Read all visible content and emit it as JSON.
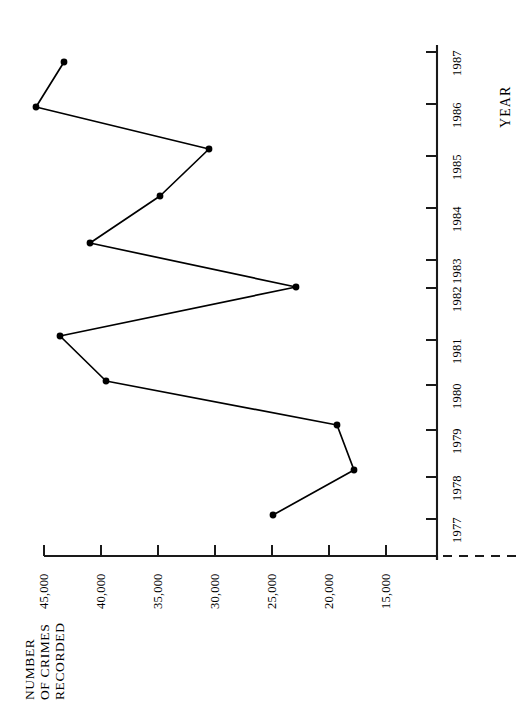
{
  "chart_data": {
    "type": "line",
    "title": "",
    "orientation": "rotated-90",
    "xlabel": "YEAR",
    "ylabel": "NUMBER OF CRIMES RECORDED",
    "ylabel_lines": [
      "NUMBER",
      "OF CRIMES",
      "RECORDED"
    ],
    "categories": [
      "1977",
      "1978",
      "1979",
      "1980",
      "1981",
      "1982",
      "1983",
      "1984",
      "1985",
      "1986",
      "1987"
    ],
    "values": [
      25000,
      17800,
      19300,
      39500,
      46400,
      22900,
      40900,
      35200,
      30900,
      45700,
      43200
    ],
    "ylim": [
      15000,
      45000
    ],
    "ytick_labels": [
      "45,000",
      "40,000",
      "35,000",
      "30,000",
      "25,000",
      "20,000",
      "15,000"
    ],
    "ytick_values": [
      45000,
      40000,
      35000,
      30000,
      25000,
      20000,
      15000
    ],
    "xtick_labels": [
      "1987",
      "1986",
      "1985",
      "1984",
      "1983",
      "1982",
      "1981",
      "1980",
      "1979",
      "1978",
      "1977"
    ],
    "grid": false,
    "legend": null,
    "marker": "filled-circle",
    "line_color": "#000000",
    "marker_color": "#000000",
    "axis_color": "#1a1a1a",
    "background_color": "#ffffff",
    "axis_break": "dashed-segment-below-15000",
    "points": [
      {
        "year": "1987",
        "value": 43200,
        "px": 64,
        "py": 62
      },
      {
        "year": "1986",
        "value": 45700,
        "px": 36,
        "py": 107
      },
      {
        "year": "1985",
        "value": 30900,
        "px": 209,
        "py": 149
      },
      {
        "year": "1984",
        "value": 35200,
        "px": 160,
        "py": 196
      },
      {
        "year": "1983",
        "value": 40900,
        "px": 90,
        "py": 243
      },
      {
        "year": "1982",
        "value": 22900,
        "px": 296,
        "py": 287
      },
      {
        "year": "1981",
        "value": 46400,
        "px": 60,
        "py": 336
      },
      {
        "year": "1980",
        "value": 39500,
        "px": 106,
        "py": 381
      },
      {
        "year": "1979",
        "value": 19300,
        "px": 337,
        "py": 425
      },
      {
        "year": "1978",
        "value": 17800,
        "px": 354,
        "py": 470
      },
      {
        "year": "1977",
        "value": 25000,
        "px": 273,
        "py": 515
      }
    ],
    "axes_geometry": {
      "year_axis_x": 437,
      "year_axis_y_top": 45,
      "year_axis_y_bottom": 560,
      "value_axis_y": 556,
      "value_axis_x_left": 44,
      "value_axis_x_right": 437,
      "year_ticks_y": [
        52,
        104,
        156,
        208,
        260,
        288,
        340,
        385,
        430,
        477,
        519
      ],
      "value_ticks_x": [
        44,
        101,
        158,
        215,
        272,
        329,
        386
      ]
    }
  }
}
